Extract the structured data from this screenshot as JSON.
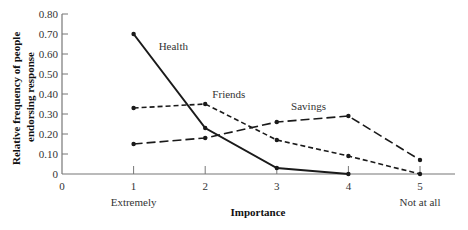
{
  "chart_data": {
    "type": "line",
    "title": "",
    "xlabel": "Importance",
    "ylabel": "Relative frequency of people endorsing response",
    "ylabel_lines": [
      "Relative frequency of people",
      "endorsing response"
    ],
    "x": [
      1,
      2,
      3,
      4,
      5
    ],
    "x_ticks": [
      "0",
      "1",
      "2",
      "3",
      "4",
      "5"
    ],
    "x_tick_values": [
      0,
      1,
      2,
      3,
      4,
      5
    ],
    "x_annotations": [
      {
        "x": 1,
        "text": "Extremely"
      },
      {
        "x": 5,
        "text": "Not at all"
      }
    ],
    "y_ticks": [
      "0",
      "0.10",
      "0.20",
      "0.30",
      "0.40",
      "0.50",
      "0.60",
      "0.70",
      "0.80"
    ],
    "y_tick_values": [
      0,
      0.1,
      0.2,
      0.3,
      0.4,
      0.5,
      0.6,
      0.7,
      0.8
    ],
    "xlim": [
      0,
      5.5
    ],
    "ylim": [
      0,
      0.8
    ],
    "grid": false,
    "legend": "inline labels",
    "series": [
      {
        "name": "Health",
        "x": [
          1,
          2,
          3,
          4
        ],
        "values": [
          0.7,
          0.23,
          0.03,
          0.0
        ],
        "style": "solid",
        "label_pos": {
          "x": 1.35,
          "y": 0.62
        }
      },
      {
        "name": "Friends",
        "x": [
          1,
          2,
          3,
          4,
          5
        ],
        "values": [
          0.33,
          0.35,
          0.17,
          0.09,
          0.0
        ],
        "style": "short-dash",
        "label_pos": {
          "x": 2.1,
          "y": 0.38
        }
      },
      {
        "name": "Savings",
        "x": [
          1,
          2,
          3,
          4,
          5
        ],
        "values": [
          0.15,
          0.18,
          0.26,
          0.29,
          0.07
        ],
        "style": "long-dash",
        "label_pos": {
          "x": 3.2,
          "y": 0.32
        }
      }
    ]
  }
}
